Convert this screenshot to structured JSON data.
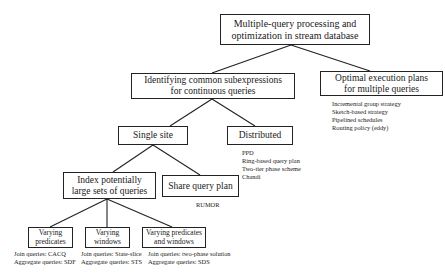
{
  "diagram": {
    "root": {
      "line1": "Multiple-query processing and",
      "line2": "optimization in stream database"
    },
    "identify": {
      "line1": "Identifying common subexpressions",
      "line2": "for continuous queries"
    },
    "optimal": {
      "line1": "Optimal execution plans",
      "line2": "for multiple queries",
      "notes": [
        "Incremental group strategy",
        "Sketch-based strategy",
        "Pipelined schedules",
        "Routing policy (eddy)"
      ]
    },
    "single_site": {
      "label": "Single site"
    },
    "distributed": {
      "label": "Distributed",
      "notes": [
        "PPD",
        "Ring-based query plan",
        "Two-tier phase scheme",
        "Chandi"
      ]
    },
    "index": {
      "line1": "Index potentially",
      "line2": "large sets of queries"
    },
    "share": {
      "label": "Share query plan",
      "notes": [
        "RUMOR"
      ]
    },
    "varying_predicates": {
      "line1": "Varying",
      "line2": "predicates",
      "notes": [
        "Join queries: CACQ",
        "Aggregate queries: SDF"
      ]
    },
    "varying_windows": {
      "line1": "Varying",
      "line2": "windows",
      "notes": [
        "Join queries: State-slice",
        "Aggregate queries: STS"
      ]
    },
    "varying_both": {
      "line1": "Varying predicates",
      "line2": "and windows",
      "notes": [
        "Join queries: two-phase solution",
        "Aggregate queries: SDS"
      ]
    }
  }
}
